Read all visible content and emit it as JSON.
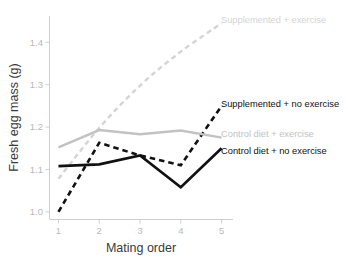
{
  "chart_data": {
    "type": "line",
    "title": "",
    "xlabel": "Mating order",
    "ylabel": "Fresh egg mass (g)",
    "x": [
      1,
      2,
      3,
      4,
      5
    ],
    "xtick_labels": [
      "1",
      "2",
      "3",
      "4",
      "5"
    ],
    "ytick_labels": [
      "1.0",
      "1.1",
      "1.2",
      "1.3",
      "1.4"
    ],
    "ytick_values": [
      1.0,
      1.1,
      1.2,
      1.3,
      1.4
    ],
    "xlim": [
      0.78,
      5.28
    ],
    "ylim": [
      0.982,
      1.462
    ],
    "grid": false,
    "legend_position": "inline-right-of-line-ends",
    "series": [
      {
        "name": "Supplemented + exercise",
        "label": "Supplemented + exercise",
        "values": [
          1.078,
          1.198,
          1.298,
          1.378,
          1.445
        ],
        "color": "#d4d4d4",
        "style": "dashed",
        "width": 2.4,
        "smooth": true,
        "label_x": 221,
        "label_y": 21
      },
      {
        "name": "Supplemented + no exercise",
        "label": "Supplemented + no exercise",
        "values": [
          1.0,
          1.163,
          1.133,
          1.11,
          1.25
        ],
        "color": "#111111",
        "style": "dashed",
        "width": 2.6,
        "smooth": false,
        "label_x": 221,
        "label_y": 105
      },
      {
        "name": "Control diet + exercise",
        "label": "Control diet + exercise",
        "values": [
          1.152,
          1.193,
          1.183,
          1.192,
          1.175
        ],
        "color": "#c2c2c2",
        "style": "solid",
        "width": 2.4,
        "smooth": false,
        "label_x": 221,
        "label_y": 135
      },
      {
        "name": "Control diet + no exercise",
        "label": "Control diet + no exercise",
        "values": [
          1.108,
          1.112,
          1.133,
          1.058,
          1.15
        ],
        "color": "#111111",
        "style": "solid",
        "width": 2.6,
        "smooth": false,
        "label_x": 221,
        "label_y": 152
      }
    ]
  },
  "colors": {
    "background": "#ffffff",
    "axis": "#cfcfcf",
    "tick_text": "#b8b8b8",
    "axis_title": "#3a3a3a",
    "dark_series": "#111111",
    "mid_gray_series": "#c2c2c2",
    "light_gray_series": "#d4d4d4"
  }
}
